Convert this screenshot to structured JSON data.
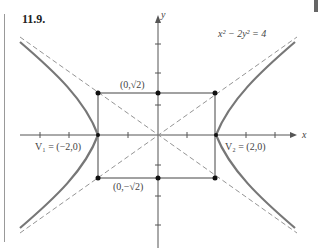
{
  "figure": {
    "number": "11.9.",
    "equation_label": "x² − 2y² = 4",
    "x_axis_label": "x",
    "y_axis_label": "y",
    "labels": {
      "top_point": "(0,√2)",
      "bottom_point": "(0,−√2)",
      "v1": "V₁ = (−2,0)",
      "v2": "V₂ = (2,0)"
    }
  },
  "diagram_data": {
    "type": "hyperbola",
    "equation": "x^2 - 2y^2 = 4",
    "vertices": [
      [
        -2,
        0
      ],
      [
        2,
        0
      ]
    ],
    "conjugate_points": [
      [
        0,
        1.414
      ],
      [
        0,
        -1.414
      ]
    ],
    "rectangle_corners": [
      [
        -2,
        1.414
      ],
      [
        2,
        1.414
      ],
      [
        2,
        -1.414
      ],
      [
        -2,
        -1.414
      ]
    ],
    "asymptotes": [
      "y = x/√2",
      "y = -x/√2"
    ],
    "x_ticks": [
      -4,
      -3,
      -2,
      -1,
      0,
      1,
      2,
      3,
      4
    ],
    "y_ticks": [
      -3,
      -2,
      -1,
      0,
      1,
      2,
      3
    ],
    "colors": {
      "curve": "#777777",
      "axis": "#555555",
      "dashed": "#888888",
      "point": "#111111"
    }
  }
}
